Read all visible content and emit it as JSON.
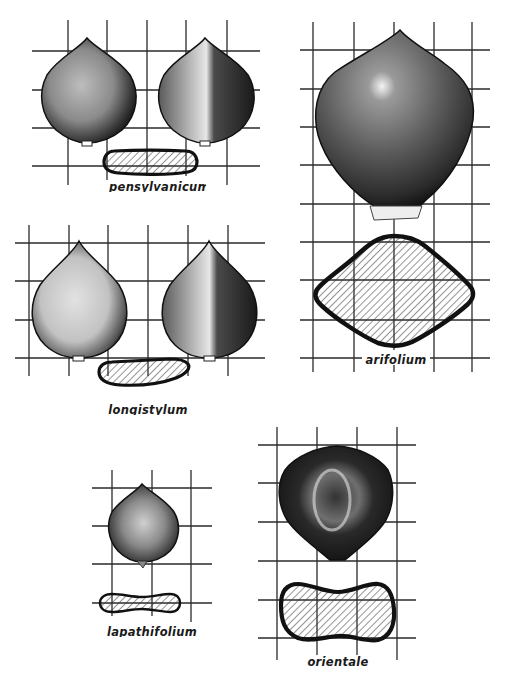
{
  "plate": {
    "type": "botanical illustration plate",
    "subject": "Polygonum achenes with cross-sections on grid",
    "colors": {
      "background": "#ffffff",
      "ink": "#1a1a1a",
      "grid": "#2a2a2a",
      "achene_dark": "#222222",
      "achene_light": "#d8d8d8"
    }
  },
  "specimens": [
    {
      "id": "pensylvanicum",
      "label": "pensylvanicum",
      "views": [
        "face view",
        "side view",
        "cross-section"
      ],
      "cross_section_shape": "flat lens"
    },
    {
      "id": "arifolium",
      "label": "arifolium",
      "views": [
        "face view",
        "cross-section"
      ],
      "cross_section_shape": "rhombic / trigonous"
    },
    {
      "id": "longistylum",
      "label": "longistylum",
      "views": [
        "face view",
        "side view",
        "cross-section"
      ],
      "cross_section_shape": "flat lens"
    },
    {
      "id": "lapathifolium",
      "label": "lapathifolium",
      "views": [
        "face view",
        "cross-section"
      ],
      "cross_section_shape": "biconcave"
    },
    {
      "id": "orientale",
      "label": "orientale",
      "views": [
        "face view",
        "cross-section"
      ],
      "cross_section_shape": "biconcave, broad"
    }
  ]
}
